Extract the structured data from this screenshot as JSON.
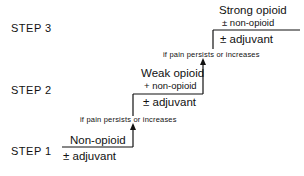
{
  "steps": [
    {
      "label": "STEP  1",
      "drug": "Non-opioid",
      "addition": "± adjuvant"
    },
    {
      "label": "STEP  2",
      "drug": "Weak opioid",
      "combo": "+ non-opioid",
      "addition": "± adjuvant"
    },
    {
      "label": "STEP  3",
      "drug": "Strong opioid",
      "combo": "± non-opioid",
      "addition": "± adjuvant"
    }
  ],
  "transitions": [
    {
      "text": "if pain persists or increases"
    },
    {
      "text": "if pain persists or increases"
    }
  ],
  "colors": {
    "line": "#111111",
    "background": "#ffffff"
  }
}
